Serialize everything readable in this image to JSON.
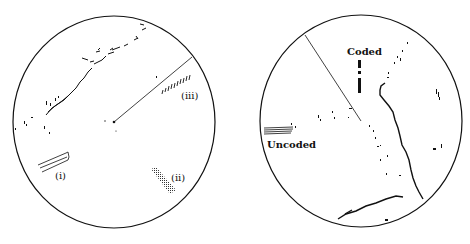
{
  "figure": {
    "panels": [
      {
        "id": "left-ppi",
        "description": "Radar PPI display with sweep line and three echo types",
        "labels": {
          "i": "(i)",
          "ii": "(ii)",
          "iii": "(iii)"
        }
      },
      {
        "id": "right-ppi",
        "description": "Radar PPI display showing coded and uncoded echoes with coastline",
        "labels": {
          "coded": "Coded",
          "uncoded": "Uncoded"
        }
      }
    ],
    "colors": {
      "ink": "#111111",
      "background": "#ffffff"
    }
  }
}
